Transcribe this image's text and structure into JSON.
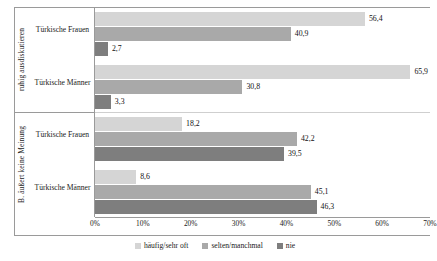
{
  "chart_data": {
    "type": "bar",
    "orientation": "horizontal",
    "grouped": true,
    "title": "",
    "subtitle": "",
    "xlabel": "",
    "ylabel": "",
    "xlim": [
      0,
      70
    ],
    "xticks": [
      "0%",
      "10%",
      "20%",
      "30%",
      "40%",
      "50%",
      "60%",
      "70%"
    ],
    "xtick_values": [
      0,
      10,
      20,
      30,
      40,
      50,
      60,
      70
    ],
    "grid": false,
    "legend_position": "bottom",
    "series": [
      {
        "name": "häufig/sehr oft",
        "color": "#d5d5d5",
        "values": [
          56.4,
          65.9,
          18.2,
          8.6
        ]
      },
      {
        "name": "selten/manchmal",
        "color": "#a9a9a9",
        "values": [
          40.9,
          30.8,
          42.2,
          45.1
        ]
      },
      {
        "name": "nie",
        "color": "#7e7e7e",
        "values": [
          2.7,
          3.3,
          39.5,
          46.3
        ]
      }
    ],
    "categories": [
      "Türkische Frauen",
      "Türkische Männer",
      "Türkische Frauen",
      "Türkische Männer"
    ],
    "group_titles": [
      "ruhig ausdiskutieren",
      "B. äußert keine Meinung"
    ],
    "groups": [
      {
        "axis_title": "ruhig ausdiskutieren",
        "categories": [
          {
            "label": "Türkische Frauen",
            "bars": [
              {
                "series": "häufig/sehr oft",
                "value": 56.4,
                "value_label": "56,4",
                "color": "#d5d5d5"
              },
              {
                "series": "selten/manchmal",
                "value": 40.9,
                "value_label": "40,9",
                "color": "#a9a9a9"
              },
              {
                "series": "nie",
                "value": 2.7,
                "value_label": "2,7",
                "color": "#7e7e7e"
              }
            ]
          },
          {
            "label": "Türkische Männer",
            "bars": [
              {
                "series": "häufig/sehr oft",
                "value": 65.9,
                "value_label": "65,9",
                "color": "#d5d5d5"
              },
              {
                "series": "selten/manchmal",
                "value": 30.8,
                "value_label": "30,8",
                "color": "#a9a9a9"
              },
              {
                "series": "nie",
                "value": 3.3,
                "value_label": "3,3",
                "color": "#7e7e7e"
              }
            ]
          }
        ]
      },
      {
        "axis_title": "B. äußert keine Meinung",
        "categories": [
          {
            "label": "Türkische Frauen",
            "bars": [
              {
                "series": "häufig/sehr oft",
                "value": 18.2,
                "value_label": "18,2",
                "color": "#d5d5d5"
              },
              {
                "series": "selten/manchmal",
                "value": 42.2,
                "value_label": "42,2",
                "color": "#a9a9a9"
              },
              {
                "series": "nie",
                "value": 39.5,
                "value_label": "39,5",
                "color": "#7e7e7e"
              }
            ]
          },
          {
            "label": "Türkische Männer",
            "bars": [
              {
                "series": "häufig/sehr oft",
                "value": 8.6,
                "value_label": "8,6",
                "color": "#d5d5d5"
              },
              {
                "series": "selten/manchmal",
                "value": 45.1,
                "value_label": "45,1",
                "color": "#a9a9a9"
              },
              {
                "series": "nie",
                "value": 46.3,
                "value_label": "46,3",
                "color": "#7e7e7e"
              }
            ]
          }
        ]
      }
    ],
    "legend": [
      {
        "label": "häufig/sehr oft",
        "color": "#d5d5d5"
      },
      {
        "label": "selten/manchmal",
        "color": "#a9a9a9"
      },
      {
        "label": "nie",
        "color": "#7e7e7e"
      }
    ]
  }
}
